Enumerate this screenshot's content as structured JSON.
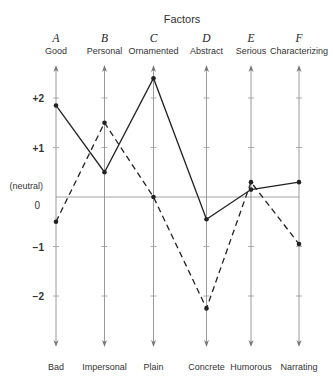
{
  "title": "Factors",
  "neutral_label": "(neutral)",
  "factors": [
    {
      "letter": "A",
      "top": "Good",
      "bottom": "Bad"
    },
    {
      "letter": "B",
      "top": "Personal",
      "bottom": "Impersonal"
    },
    {
      "letter": "C",
      "top": "Ornamented",
      "bottom": "Plain"
    },
    {
      "letter": "D",
      "top": "Abstract",
      "bottom": "Concrete"
    },
    {
      "letter": "E",
      "top": "Serious",
      "bottom": "Humorous"
    },
    {
      "letter": "F",
      "top": "Characterizing",
      "bottom": "Narrating"
    }
  ],
  "y_ticks": [
    {
      "value": 2,
      "label": "+2"
    },
    {
      "value": 1,
      "label": "+1"
    },
    {
      "value": 0,
      "label": "0"
    },
    {
      "value": -1,
      "label": "−1"
    },
    {
      "value": -2,
      "label": "−2"
    }
  ],
  "colors": {
    "axis": "#9a9a9a",
    "series": "#222222",
    "text": "#333333"
  },
  "chart_data": {
    "type": "line",
    "title": "Factors",
    "categories": [
      "A Good/Bad",
      "B Personal/Impersonal",
      "C Ornamented/Plain",
      "D Abstract/Concrete",
      "E Serious/Humorous",
      "F Characterizing/Narrating"
    ],
    "top_labels": [
      "Good",
      "Personal",
      "Ornamented",
      "Abstract",
      "Serious",
      "Characterizing"
    ],
    "bottom_labels": [
      "Bad",
      "Impersonal",
      "Plain",
      "Concrete",
      "Humorous",
      "Narrating"
    ],
    "factor_letters": [
      "A",
      "B",
      "C",
      "D",
      "E",
      "F"
    ],
    "series": [
      {
        "name": "solid",
        "style": "solid",
        "values": [
          1.85,
          0.5,
          2.4,
          -0.45,
          0.15,
          0.3
        ]
      },
      {
        "name": "dashed",
        "style": "dashed",
        "values": [
          -0.5,
          1.5,
          0.0,
          -2.25,
          0.3,
          -0.95
        ]
      }
    ],
    "ylim": [
      -3,
      2.7
    ],
    "yticks": [
      -2,
      -1,
      0,
      1,
      2
    ],
    "ytick_labels": [
      "−2",
      "−1",
      "0",
      "+1",
      "+2"
    ],
    "annotations": [
      "(neutral) at 0"
    ],
    "grid": false,
    "legend": "none",
    "xlabel": "",
    "ylabel": ""
  }
}
